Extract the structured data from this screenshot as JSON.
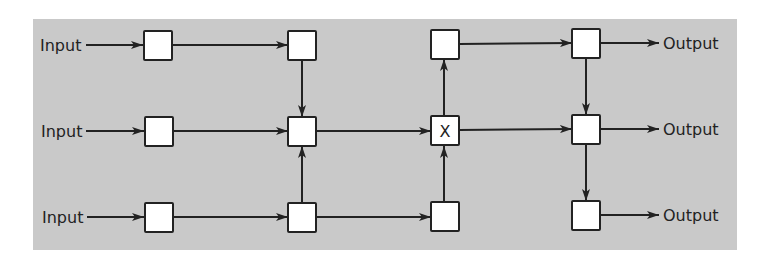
{
  "diagram": {
    "background": "#c9c9c9",
    "line_color": "#222222",
    "box_fill": "#ffffff",
    "labels": {
      "inputs": [
        "Input",
        "Input",
        "Input"
      ],
      "outputs": [
        "Output",
        "Output",
        "Output"
      ],
      "center_node": "X"
    },
    "nodes": [
      {
        "id": "r1c1",
        "row": 1,
        "col": 1,
        "label": ""
      },
      {
        "id": "r1c2",
        "row": 1,
        "col": 2,
        "label": ""
      },
      {
        "id": "r1c3",
        "row": 1,
        "col": 3,
        "label": ""
      },
      {
        "id": "r1c4",
        "row": 1,
        "col": 4,
        "label": ""
      },
      {
        "id": "r2c1",
        "row": 2,
        "col": 1,
        "label": ""
      },
      {
        "id": "r2c2",
        "row": 2,
        "col": 2,
        "label": ""
      },
      {
        "id": "r2c3",
        "row": 2,
        "col": 3,
        "label": "X"
      },
      {
        "id": "r2c4",
        "row": 2,
        "col": 4,
        "label": ""
      },
      {
        "id": "r3c1",
        "row": 3,
        "col": 1,
        "label": ""
      },
      {
        "id": "r3c2",
        "row": 3,
        "col": 2,
        "label": ""
      },
      {
        "id": "r3c3",
        "row": 3,
        "col": 3,
        "label": ""
      },
      {
        "id": "r3c4",
        "row": 3,
        "col": 4,
        "label": ""
      }
    ],
    "edges": [
      [
        "Input1",
        "r1c1"
      ],
      [
        "r1c1",
        "r1c2"
      ],
      [
        "r1c2",
        "r2c2"
      ],
      [
        "Input2",
        "r2c1"
      ],
      [
        "r2c1",
        "r2c2"
      ],
      [
        "r3c2",
        "r2c2"
      ],
      [
        "r2c2",
        "r2c3"
      ],
      [
        "Input3",
        "r3c1"
      ],
      [
        "r3c1",
        "r3c2"
      ],
      [
        "r3c2",
        "r3c3"
      ],
      [
        "r3c3",
        "r2c3"
      ],
      [
        "r2c3",
        "r1c3"
      ],
      [
        "r1c3",
        "r1c4"
      ],
      [
        "r2c3",
        "r2c4"
      ],
      [
        "r1c4",
        "r2c4"
      ],
      [
        "r2c4",
        "r3c4"
      ],
      [
        "r1c4",
        "Output1"
      ],
      [
        "r2c4",
        "Output2"
      ],
      [
        "r3c4",
        "Output3"
      ]
    ]
  }
}
